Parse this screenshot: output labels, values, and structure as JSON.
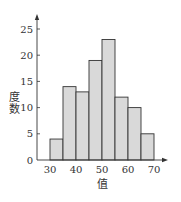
{
  "chart_data": {
    "type": "bar",
    "subtype": "histogram",
    "title": "",
    "xlabel": "值",
    "ylabel": "度数",
    "bins": [
      {
        "start": 30,
        "end": 35,
        "value": 4
      },
      {
        "start": 35,
        "end": 40,
        "value": 14
      },
      {
        "start": 40,
        "end": 45,
        "value": 13
      },
      {
        "start": 45,
        "end": 50,
        "value": 19
      },
      {
        "start": 50,
        "end": 55,
        "value": 23
      },
      {
        "start": 55,
        "end": 60,
        "value": 12
      },
      {
        "start": 60,
        "end": 65,
        "value": 10
      },
      {
        "start": 65,
        "end": 70,
        "value": 5
      }
    ],
    "x_ticks": [
      30,
      40,
      50,
      60,
      70
    ],
    "y_ticks": [
      0,
      5,
      10,
      15,
      20,
      25
    ],
    "xlim": [
      25,
      75
    ],
    "ylim": [
      0,
      28
    ],
    "grid": false,
    "legend": "none",
    "colors": {
      "bar_fill": "#d9d9d9",
      "bar_edge": "#333333",
      "axis": "#333333"
    }
  }
}
